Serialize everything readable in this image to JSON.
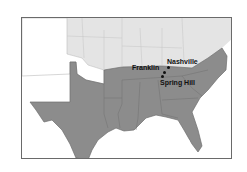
{
  "map": {
    "title": "",
    "colors": {
      "confederacy": "#8c8c8c",
      "union": "#e2e2e2",
      "territories": "#ffffff",
      "borders": "#6e6e6e",
      "frame": "#6a6a6a",
      "labels": "#111111"
    },
    "places": [
      {
        "name": "Nashville",
        "label": "Nashville"
      },
      {
        "name": "Franklin",
        "label": "Franklin"
      },
      {
        "name": "Spring Hill",
        "label": "Spring Hill"
      }
    ]
  }
}
